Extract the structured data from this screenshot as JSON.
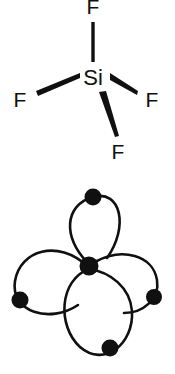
{
  "figure": {
    "background_color": "#ffffff",
    "ink_color": "#101010",
    "width": 175,
    "height": 374
  },
  "molecule": {
    "name": "SiF4",
    "center_atom": {
      "symbol": "Si",
      "x": 93,
      "y": 79
    },
    "ligands": [
      {
        "id": "fluorine-top",
        "symbol": "F",
        "x": 93,
        "y": 8,
        "bond_style": "plain-line"
      },
      {
        "id": "fluorine-left",
        "symbol": "F",
        "x": 20,
        "y": 101,
        "bond_style": "wedge"
      },
      {
        "id": "fluorine-right",
        "symbol": "F",
        "x": 152,
        "y": 101,
        "bond_style": "wedge"
      },
      {
        "id": "fluorine-bottom-right",
        "symbol": "F",
        "x": 118,
        "y": 153,
        "bond_style": "wedge"
      }
    ]
  },
  "orbital_diagram": {
    "name": "sp3-hybrid-orbital-lobes",
    "center_node": {
      "x": 87,
      "y": 266,
      "r": 9
    },
    "lobes": [
      {
        "id": "lobe-top",
        "tip_x": 93,
        "tip_y": 197,
        "tip_r": 8.5
      },
      {
        "id": "lobe-left",
        "tip_x": 20,
        "tip_y": 300,
        "tip_r": 8.5
      },
      {
        "id": "lobe-right",
        "tip_x": 154,
        "tip_y": 297,
        "tip_r": 8.0
      },
      {
        "id": "lobe-bottom",
        "tip_x": 110,
        "tip_y": 348,
        "tip_r": 8.5
      }
    ]
  }
}
